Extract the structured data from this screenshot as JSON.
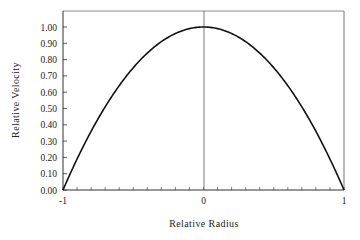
{
  "chart_data": {
    "type": "line",
    "title": "",
    "xlabel": "Relative Radius",
    "ylabel": "Relative Velocity",
    "xlim": [
      -1,
      1
    ],
    "ylim": [
      0,
      1.1
    ],
    "x_ticks": [
      "-1",
      "0",
      "1"
    ],
    "y_ticks": [
      "0.00",
      "0.10",
      "0.20",
      "0.30",
      "0.40",
      "0.50",
      "0.60",
      "0.70",
      "0.80",
      "0.90",
      "1.00"
    ],
    "grid": false,
    "legend": null,
    "series": [
      {
        "name": "Velocity profile",
        "x": [
          -1.0,
          -0.9,
          -0.8,
          -0.7,
          -0.6,
          -0.5,
          -0.4,
          -0.3,
          -0.2,
          -0.1,
          0.0,
          0.1,
          0.2,
          0.3,
          0.4,
          0.5,
          0.6,
          0.7,
          0.8,
          0.9,
          1.0
        ],
        "y": [
          0.0,
          0.19,
          0.36,
          0.51,
          0.64,
          0.75,
          0.84,
          0.91,
          0.96,
          0.99,
          1.0,
          0.99,
          0.96,
          0.91,
          0.84,
          0.75,
          0.64,
          0.51,
          0.36,
          0.19,
          0.0
        ]
      }
    ]
  }
}
